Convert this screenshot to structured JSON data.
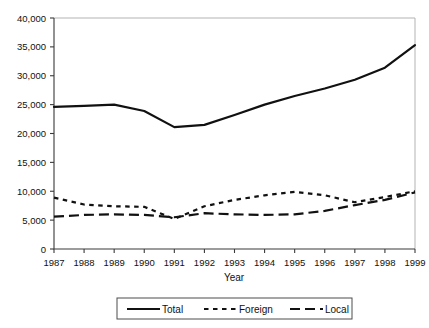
{
  "chart_data": {
    "type": "line",
    "title": "",
    "xlabel": "Year",
    "ylabel": "",
    "categories": [
      "1987",
      "1988",
      "1989",
      "1990",
      "1991",
      "1992",
      "1993",
      "1994",
      "1995",
      "1996",
      "1997",
      "1998",
      "1999"
    ],
    "x": [
      1987,
      1988,
      1989,
      1990,
      1991,
      1992,
      1993,
      1994,
      1995,
      1996,
      1997,
      1998,
      1999
    ],
    "xlim": [
      1987,
      1999
    ],
    "ylim": [
      0,
      40000
    ],
    "ytick_labels": [
      "0",
      "5,000",
      "10,000",
      "15,000",
      "20,000",
      "25,000",
      "30,000",
      "35,000",
      "40,000"
    ],
    "ytick_values": [
      0,
      5000,
      10000,
      15000,
      20000,
      25000,
      30000,
      35000,
      40000
    ],
    "grid": false,
    "legend_position": "bottom",
    "series": [
      {
        "name": "Total",
        "style": "solid",
        "color": "#111111",
        "values": [
          24600,
          24800,
          25000,
          23900,
          21100,
          21500,
          23200,
          25000,
          26500,
          27800,
          29300,
          31400,
          35300
        ]
      },
      {
        "name": "Foreign",
        "style": "dotted",
        "color": "#111111",
        "values": [
          8900,
          7700,
          7400,
          7300,
          5200,
          7400,
          8500,
          9300,
          9900,
          9300,
          8100,
          9000,
          10000
        ]
      },
      {
        "name": "Local",
        "style": "dashed",
        "color": "#111111",
        "values": [
          5600,
          5900,
          6000,
          5900,
          5500,
          6200,
          6000,
          5900,
          6000,
          6600,
          7600,
          8500,
          9800
        ]
      }
    ]
  },
  "legend": {
    "items": [
      {
        "label": "Total",
        "style": "solid"
      },
      {
        "label": "Foreign",
        "style": "dotted"
      },
      {
        "label": "Local",
        "style": "dashed"
      }
    ]
  },
  "axis": {
    "x_title": "Year"
  }
}
